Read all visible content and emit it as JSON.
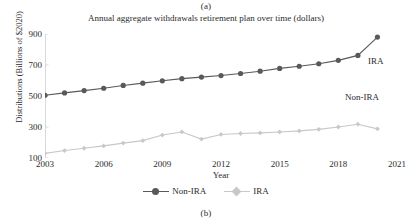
{
  "figure": {
    "caption_top": "(a)",
    "caption_bottom": "(b)"
  },
  "chart_data": {
    "type": "line",
    "title": "Annual aggregate withdrawals retirement plan over time (dollars)",
    "xlabel": "Year",
    "ylabel": "Distributions (Billions of $2020)",
    "xlim": [
      2003,
      2021
    ],
    "ylim": [
      100,
      900
    ],
    "xticks": [
      2003,
      2006,
      2009,
      2012,
      2015,
      2018,
      2021
    ],
    "yticks": [
      100,
      300,
      500,
      700,
      900
    ],
    "grid": false,
    "legend_position": "bottom-center",
    "x": [
      2003,
      2004,
      2005,
      2006,
      2007,
      2008,
      2009,
      2010,
      2011,
      2012,
      2013,
      2014,
      2015,
      2016,
      2017,
      2018,
      2019,
      2020
    ],
    "series": [
      {
        "name": "Non-IRA",
        "color": "#595959",
        "marker": "circle",
        "values": [
          505,
          520,
          535,
          550,
          568,
          583,
          598,
          612,
          622,
          632,
          645,
          660,
          678,
          692,
          708,
          730,
          762,
          880
        ]
      },
      {
        "name": "IRA",
        "color": "#c8c8c8",
        "marker": "diamond",
        "values": [
          130,
          148,
          163,
          178,
          196,
          212,
          248,
          268,
          222,
          252,
          258,
          262,
          268,
          275,
          285,
          300,
          318,
          288
        ]
      }
    ],
    "annotations": [
      {
        "text": "IRA",
        "x_px": 368,
        "y_px": 56
      },
      {
        "text": "Non-IRA",
        "x_px": 345,
        "y_px": 92
      }
    ],
    "legend": [
      {
        "label": "Non-IRA",
        "color": "#595959",
        "marker": "circle"
      },
      {
        "label": "IRA",
        "color": "#c8c8c8",
        "marker": "diamond"
      }
    ]
  }
}
